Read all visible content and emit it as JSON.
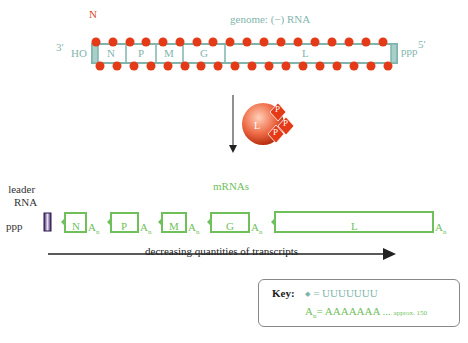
{
  "genome": {
    "title": "genome: (−) RNA",
    "n_protein_label": "N",
    "end_3": "3'",
    "end_3_group": "HO",
    "end_5": "5'",
    "end_5_group": "ppp",
    "segments": [
      "N",
      "P",
      "M",
      "G",
      "L"
    ]
  },
  "polymerase": {
    "core_label": "L",
    "p_labels": [
      "P",
      "P",
      "P"
    ]
  },
  "transcription": {
    "leader_label_line1": "leader",
    "leader_label_line2": "RNA",
    "leader_group": "ppp",
    "mrnas_label": "mRNAs",
    "mrnas": [
      "N",
      "P",
      "M",
      "G",
      "L"
    ],
    "poly_a": "A",
    "poly_a_sub": "n",
    "arrow_label": "decreasing quantities of transcripts"
  },
  "key": {
    "title": "Key:",
    "line1": "= UUUUUUU",
    "line2_main": "= AAAAAAA ...",
    "line2_sub": "approx. 150",
    "line2_prefix": "A",
    "line2_prefix_sub": "n"
  },
  "colors": {
    "teal": "#7fb5ad",
    "red": "#e53a17",
    "green": "#6fbf5a",
    "leader": "#5a3d82"
  }
}
